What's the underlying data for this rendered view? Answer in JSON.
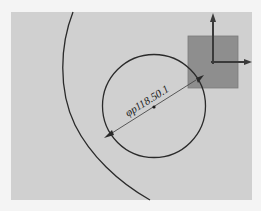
{
  "viewport": {
    "background": "#f4f4f4",
    "sketch_area": {
      "x": 11,
      "y": 12,
      "width": 241,
      "height": 188,
      "color": "#d0d0d0"
    }
  },
  "sketch": {
    "large_arc": {
      "label": "large-arc",
      "color": "#2a2a2a"
    },
    "circle": {
      "cx": 154,
      "cy": 106,
      "r": 51.5,
      "color": "#2a2a2a"
    },
    "center_point": {
      "cx": 154,
      "cy": 107
    },
    "dimension": {
      "text": "φp118.50.1",
      "x1": 112,
      "y1": 133,
      "x2": 196,
      "y2": 80,
      "color": "#4a4a4a"
    },
    "coordinate_box": {
      "x": 188,
      "y": 36,
      "width": 50,
      "height": 52,
      "color": "#8e8e8e"
    },
    "axis": {
      "origin": {
        "x": 213,
        "y": 62
      },
      "y_tip": {
        "x": 213,
        "y": 13
      },
      "x_tip": {
        "x": 252,
        "y": 62
      },
      "color": "#3a3a3a"
    }
  }
}
